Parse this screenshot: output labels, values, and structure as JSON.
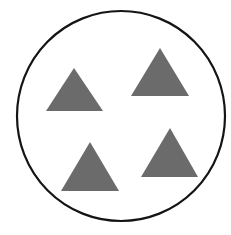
{
  "canvas": {
    "width": 231,
    "height": 235,
    "background_color": "#FFFFFF"
  },
  "figure": {
    "enclosure": {
      "shape_name": "circle",
      "stroke_color": "#141414",
      "stroke_width": 2.2,
      "fill_color": "none",
      "center_x": 121,
      "center_y": 116,
      "radius_x": 104,
      "radius_y": 105
    },
    "shape_color": "#6B6B6B",
    "shape_count": 4,
    "shape_type": "triangle",
    "shapes": [
      {
        "label": "triangle-top-left",
        "apex_x": 74,
        "apex_y": 68,
        "base_left_x": 46,
        "base_right_x": 103,
        "base_y": 111,
        "points": "74,68 103,111 46,111"
      },
      {
        "label": "triangle-top-right",
        "apex_x": 160,
        "apex_y": 48,
        "base_left_x": 131,
        "base_right_x": 189,
        "base_y": 96,
        "points": "160,48 189,96 131,96"
      },
      {
        "label": "triangle-bottom-left",
        "apex_x": 90,
        "apex_y": 142,
        "base_left_x": 61,
        "base_right_x": 119,
        "base_y": 191,
        "points": "90,142 119,191 61,191"
      },
      {
        "label": "triangle-bottom-right",
        "apex_x": 170,
        "apex_y": 128,
        "base_left_x": 141,
        "base_right_x": 198,
        "base_y": 177,
        "points": "170,128 198,177 141,177"
      }
    ]
  }
}
